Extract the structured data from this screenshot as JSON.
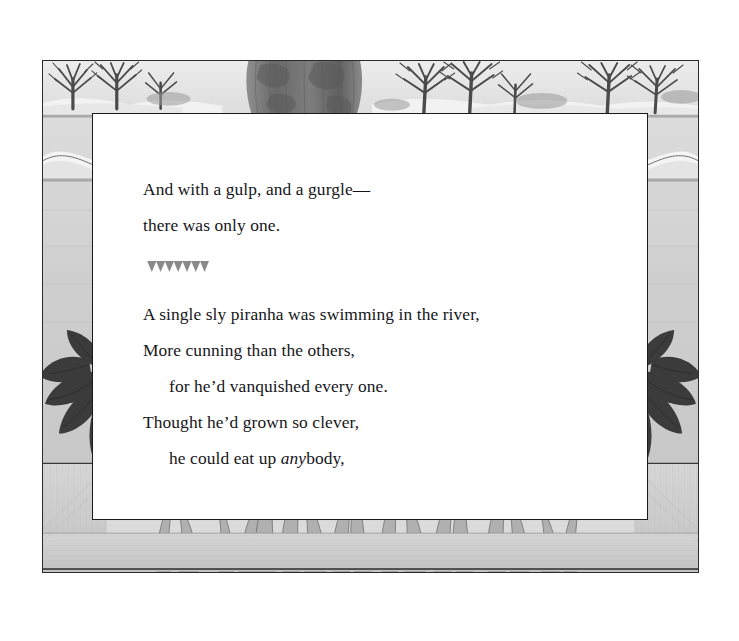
{
  "page": {
    "background_color": "#ffffff",
    "frame": {
      "border_color": "#2b2b2b",
      "scene_name": "river-bank-landscape-border"
    }
  },
  "illustration": {
    "name": "river-scene-border",
    "regions": {
      "top": "distant-shoreline-with-bare-trees-and-large-dark-tree-trunk",
      "left": "river-water-with-dark-pointed-leaves",
      "right": "river-water-with-dark-pointed-leaves",
      "bottom": "underwater-reeds-and-wood-grain-riverbed"
    },
    "colors": {
      "water": "#cfcfcf",
      "sky": "#e8e8e8",
      "bank": "#efefef",
      "tree_dark": "#585858",
      "trunk_dark": "#6d6d6d",
      "leaf_dark": "#3a3a3a",
      "reed": "#b3b3b3",
      "wood": "#cdcdcd",
      "outline": "#2b2b2b"
    }
  },
  "text_panel": {
    "name": "poem-text-box",
    "background_color": "#ffffff",
    "border_color": "#1a1a1a"
  },
  "poem": {
    "stanza_one": [
      {
        "text": "And with a gulp, and a gurgle—",
        "indent": false
      },
      {
        "text": "there was only one.",
        "indent": false
      }
    ],
    "ornament": {
      "name": "sawtooth-divider",
      "teeth": 7,
      "color": "#8a8a8a"
    },
    "stanza_two": [
      {
        "text": "A single sly piranha was swimming in the river,",
        "indent": false
      },
      {
        "text": "More cunning than the others,",
        "indent": false
      },
      {
        "text": "for he’d vanquished every one.",
        "indent": true
      },
      {
        "text": "Thought he’d grown so clever,",
        "indent": false
      },
      {
        "text_before": "he could eat up ",
        "italic": "any",
        "text_after": "body,",
        "indent": true
      }
    ]
  }
}
